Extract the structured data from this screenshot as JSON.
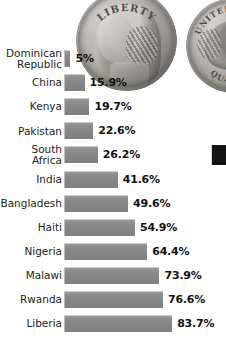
{
  "chart_data": {
    "type": "bar",
    "orientation": "horizontal",
    "title": "",
    "xlabel": "",
    "ylabel": "",
    "xlim": [
      0,
      100
    ],
    "grid": false,
    "legend": null,
    "value_suffix": "%",
    "categories": [
      "Dominican\nRepublic",
      "China",
      "Kenya",
      "Pakistan",
      "South Africa",
      "India",
      "Bangladesh",
      "Haiti",
      "Nigeria",
      "Malawi",
      "Rwanda",
      "Liberia"
    ],
    "values": [
      5,
      15.9,
      19.7,
      22.6,
      26.2,
      41.6,
      49.6,
      54.9,
      64.4,
      73.9,
      76.6,
      83.7
    ],
    "value_labels": [
      "5%",
      "15.9%",
      "19.7%",
      "22.6%",
      "26.2%",
      "41.6%",
      "49.6%",
      "54.9%",
      "64.4%",
      "73.9%",
      "76.6%",
      "83.7%"
    ]
  },
  "style": {
    "bar_color": "#8a8a8a",
    "bar_highlight": "#c9c9c9",
    "label_color": "#1c1c1c",
    "value_color": "#111111",
    "background": "#ffffff",
    "marker_color": "#141414"
  },
  "background_art": {
    "coin_front": {
      "name": "us-quarter-obverse",
      "inscription_top": "LIBERTY",
      "subject": "George Washington portrait"
    },
    "coin_back": {
      "name": "us-quarter-reverse",
      "inscription_top": "UNITED STATES",
      "inscription_bottom": "QUARTER",
      "subject": "Eagle"
    }
  }
}
